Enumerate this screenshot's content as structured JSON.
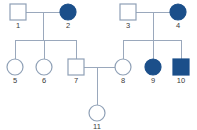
{
  "diagram": {
    "type": "pedigree-chart",
    "generations": 3,
    "colors": {
      "background": "#ffffff",
      "line": "#9aa8bc",
      "symbol_stroke": "#8fa0b6",
      "affected_fill": "#1b4f8a",
      "unaffected_fill": "#ffffff",
      "label_text": "#3a3a3a"
    },
    "legend_meaning": {
      "square": "male",
      "circle": "female",
      "filled": "affected",
      "open": "unaffected"
    },
    "individuals": [
      {
        "id": "1",
        "label": "1",
        "sex": "male",
        "affected": false,
        "generation": 1,
        "cx": 18,
        "cy": 12,
        "size": 16
      },
      {
        "id": "2",
        "label": "2",
        "sex": "female",
        "affected": true,
        "generation": 1,
        "cx": 68,
        "cy": 12,
        "size": 16
      },
      {
        "id": "3",
        "label": "3",
        "sex": "male",
        "affected": false,
        "generation": 1,
        "cx": 128,
        "cy": 12,
        "size": 16
      },
      {
        "id": "4",
        "label": "4",
        "sex": "female",
        "affected": true,
        "generation": 1,
        "cx": 178,
        "cy": 12,
        "size": 16
      },
      {
        "id": "5",
        "label": "5",
        "sex": "female",
        "affected": false,
        "generation": 2,
        "cx": 15,
        "cy": 67,
        "size": 16
      },
      {
        "id": "6",
        "label": "6",
        "sex": "female",
        "affected": false,
        "generation": 2,
        "cx": 44,
        "cy": 67,
        "size": 16
      },
      {
        "id": "7",
        "label": "7",
        "sex": "male",
        "affected": false,
        "generation": 2,
        "cx": 76,
        "cy": 67,
        "size": 16
      },
      {
        "id": "8",
        "label": "8",
        "sex": "female",
        "affected": false,
        "generation": 2,
        "cx": 123,
        "cy": 67,
        "size": 16
      },
      {
        "id": "9",
        "label": "9",
        "sex": "female",
        "affected": true,
        "generation": 2,
        "cx": 153,
        "cy": 67,
        "size": 16
      },
      {
        "id": "10",
        "label": "10",
        "sex": "male",
        "affected": true,
        "generation": 2,
        "cx": 181,
        "cy": 67,
        "size": 16
      },
      {
        "id": "11",
        "label": "11",
        "sex": "female",
        "affected": false,
        "generation": 3,
        "cx": 97,
        "cy": 113,
        "size": 16
      }
    ],
    "matings": [
      {
        "id": "m1",
        "partners": [
          "1",
          "2"
        ],
        "children": [
          "5",
          "6",
          "7"
        ]
      },
      {
        "id": "m2",
        "partners": [
          "3",
          "4"
        ],
        "children": [
          "8",
          "9",
          "10"
        ]
      },
      {
        "id": "m3",
        "partners": [
          "7",
          "8"
        ],
        "children": [
          "11"
        ]
      }
    ],
    "lines": {
      "mating_1": {
        "x1": 26,
        "y1": 12,
        "x2": 60,
        "y2": 12
      },
      "drop_1": {
        "x1": 43,
        "y1": 12,
        "x2": 43,
        "y2": 40
      },
      "sibship_1": {
        "x1": 15,
        "y1": 40,
        "x2": 76,
        "y2": 40
      },
      "stem_5": {
        "x1": 15,
        "y1": 40,
        "x2": 15,
        "y2": 59
      },
      "stem_6": {
        "x1": 44,
        "y1": 40,
        "x2": 44,
        "y2": 59
      },
      "stem_7": {
        "x1": 76,
        "y1": 40,
        "x2": 76,
        "y2": 59
      },
      "mating_2": {
        "x1": 136,
        "y1": 12,
        "x2": 170,
        "y2": 12
      },
      "drop_2": {
        "x1": 153,
        "y1": 12,
        "x2": 153,
        "y2": 40
      },
      "sibship_2": {
        "x1": 123,
        "y1": 40,
        "x2": 181,
        "y2": 40
      },
      "stem_8": {
        "x1": 123,
        "y1": 40,
        "x2": 123,
        "y2": 59
      },
      "stem_9": {
        "x1": 153,
        "y1": 40,
        "x2": 153,
        "y2": 59
      },
      "stem_10": {
        "x1": 181,
        "y1": 40,
        "x2": 181,
        "y2": 59
      },
      "mating_3": {
        "x1": 84,
        "y1": 67,
        "x2": 115,
        "y2": 67
      },
      "drop_3": {
        "x1": 97,
        "y1": 67,
        "x2": 97,
        "y2": 105
      }
    },
    "label_offset_y": 14
  }
}
